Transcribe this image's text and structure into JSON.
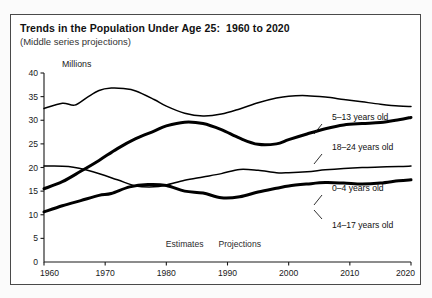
{
  "title": "Trends in the Population Under Age 25:  1960 to 2020",
  "subtitle": "(Middle series projections)",
  "chart_data": {
    "type": "line",
    "title": "Trends in the Population Under Age 25:  1960 to 2020",
    "subtitle": "(Middle series projections)",
    "xlabel": "",
    "ylabel": "Millions",
    "xlim": [
      1960,
      2020
    ],
    "ylim": [
      0,
      40
    ],
    "yticks": [
      0,
      5,
      10,
      15,
      20,
      25,
      30,
      35,
      40
    ],
    "xticks": [
      1960,
      1970,
      1980,
      1990,
      2000,
      2010,
      2020
    ],
    "grid": false,
    "legend_position": "inline-right-labels",
    "annotations": [
      {
        "text": "Estimates",
        "x": 1983,
        "y": 3.2
      },
      {
        "text": "Projections",
        "x": 1992,
        "y": 3.2
      }
    ],
    "series": [
      {
        "name": "5-13 years old",
        "label": "5–13 years old",
        "x": [
          1960,
          1963,
          1965,
          1967,
          1969,
          1971,
          1973,
          1975,
          1978,
          1980,
          1983,
          1986,
          1989,
          1992,
          1995,
          1998,
          2000,
          2003,
          2006,
          2009,
          2012,
          2015,
          2018,
          2020
        ],
        "values": [
          32.5,
          33.6,
          33.2,
          34.8,
          36.3,
          36.8,
          36.7,
          36.2,
          34.4,
          33.0,
          31.5,
          30.9,
          31.3,
          32.4,
          33.7,
          34.7,
          35.1,
          35.2,
          34.9,
          34.4,
          33.9,
          33.4,
          33.0,
          32.9
        ]
      },
      {
        "name": "18-24 years old",
        "label": "18–24 years old",
        "x": [
          1960,
          1963,
          1966,
          1969,
          1972,
          1975,
          1978,
          1980,
          1983,
          1986,
          1989,
          1992,
          1995,
          1998,
          2000,
          2003,
          2006,
          2009,
          2012,
          2015,
          2018,
          2020
        ],
        "values": [
          15.5,
          17.0,
          19.2,
          21.5,
          24.0,
          26.1,
          27.7,
          28.8,
          29.6,
          29.3,
          28.0,
          26.2,
          24.9,
          25.0,
          25.9,
          27.1,
          28.2,
          29.0,
          29.3,
          29.5,
          30.1,
          30.6
        ]
      },
      {
        "name": "0-4 years old",
        "label": "0–4 years old",
        "x": [
          1960,
          1964,
          1968,
          1972,
          1975,
          1978,
          1980,
          1983,
          1986,
          1989,
          1992,
          1995,
          1998,
          2000,
          2003,
          2006,
          2009,
          2012,
          2015,
          2018,
          2020
        ],
        "values": [
          20.3,
          20.2,
          19.1,
          17.4,
          16.1,
          15.9,
          16.3,
          17.3,
          18.0,
          18.7,
          19.6,
          19.4,
          18.9,
          18.9,
          19.1,
          19.5,
          19.8,
          20.0,
          20.1,
          20.2,
          20.3
        ]
      },
      {
        "name": "14-17 years old",
        "label": "14–17 years old",
        "x": [
          1960,
          1963,
          1966,
          1969,
          1971,
          1974,
          1977,
          1980,
          1983,
          1986,
          1989,
          1992,
          1995,
          1998,
          2000,
          2003,
          2006,
          2009,
          2012,
          2015,
          2018,
          2020
        ],
        "values": [
          10.6,
          11.9,
          13.0,
          14.1,
          14.5,
          15.9,
          16.4,
          16.2,
          15.0,
          14.6,
          13.6,
          13.8,
          14.8,
          15.6,
          16.1,
          16.5,
          16.8,
          16.7,
          16.5,
          16.7,
          17.2,
          17.4
        ]
      }
    ]
  },
  "series_labels": [
    {
      "name": "series-label-5-13",
      "text": "5–13 years old"
    },
    {
      "name": "series-label-18-24",
      "text": "18–24 years old"
    },
    {
      "name": "series-label-0-4",
      "text": "0–4 years old"
    },
    {
      "name": "series-label-14-17",
      "text": "14–17 years old"
    }
  ],
  "annotation_estimates": "Estimates",
  "annotation_projections": "Projections",
  "axis": {
    "ylabel": "Millions",
    "yticks": [
      "40",
      "35",
      "30",
      "25",
      "20",
      "15",
      "10",
      "5",
      "0"
    ],
    "xticks": [
      "1960",
      "1970",
      "1980",
      "1990",
      "2000",
      "2010",
      "2020"
    ]
  },
  "colors": {
    "line": "#000000",
    "axis": "#1a1a1a",
    "frame": "#4a4a4a",
    "page_bg": "#fbfbfb",
    "panel_bg": "#ffffff"
  }
}
